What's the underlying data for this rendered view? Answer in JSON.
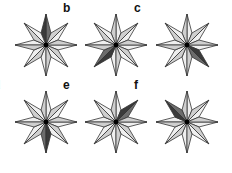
{
  "figure": {
    "colors": {
      "light_cw_half": "#efefef",
      "light_ccw_half": "#cfcfcf",
      "dark_cw_half": "#6c6c6c",
      "dark_ccw_half": "#3a3a3a",
      "stroke": "#333333",
      "center": "#000000"
    },
    "panels": [
      {
        "label": "a",
        "dark_point": "N",
        "cx": 46,
        "cy": 45
      },
      {
        "label": "b",
        "dark_point": "SW",
        "cx": 116,
        "cy": 45
      },
      {
        "label": "c",
        "dark_point": "SE",
        "cx": 187,
        "cy": 45
      },
      {
        "label": "d",
        "dark_point": "S",
        "cx": 46,
        "cy": 122
      },
      {
        "label": "e",
        "dark_point": "NE",
        "cx": 116,
        "cy": 122
      },
      {
        "label": "f",
        "dark_point": "NW",
        "cx": 187,
        "cy": 122
      }
    ]
  }
}
